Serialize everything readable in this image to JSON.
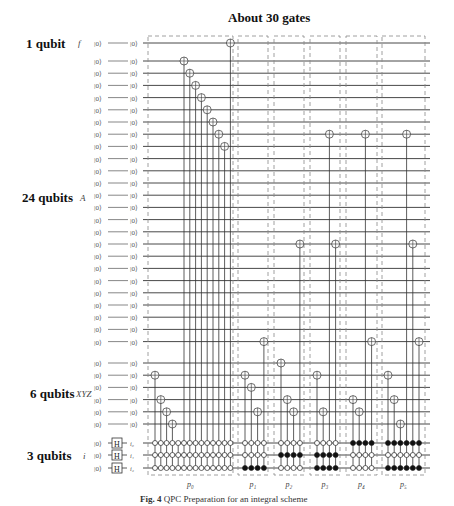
{
  "title": "About 30 gates",
  "caption": {
    "label": "Fig. 4",
    "text": "QPC Preparation for an integral scheme"
  },
  "registers": [
    {
      "group_label": "1 qubit",
      "name": "f",
      "count": 1,
      "init": "|0⟩"
    },
    {
      "group_label": "24 qubits",
      "name": "A",
      "count": 24,
      "init": "|0⟩"
    },
    {
      "group_label": "6 qubits",
      "name": "XYZ",
      "count": 6,
      "init": "|0⟩"
    },
    {
      "group_label": "3 qubits",
      "name": "i",
      "count": 3,
      "init": "|0⟩",
      "gate": "H",
      "wire_labels": [
        "i₀",
        "i₁",
        "i₂"
      ]
    }
  ],
  "blocks": [
    {
      "label": "p₀",
      "controls": [
        "open",
        "open",
        "open"
      ],
      "columns": 14,
      "targets": [
        [
          "XYZ",
          1
        ],
        [
          "XYZ",
          3
        ],
        [
          "XYZ",
          4
        ],
        [
          "XYZ",
          5
        ],
        null,
        [
          "A",
          0
        ],
        [
          "A",
          1
        ],
        [
          "A",
          2
        ],
        [
          "A",
          3
        ],
        [
          "A",
          4
        ],
        [
          "A",
          5
        ],
        [
          "A",
          6
        ],
        [
          "A",
          7
        ],
        [
          "f",
          0
        ]
      ]
    },
    {
      "label": "p₁",
      "controls": [
        "open",
        "open",
        "filled"
      ],
      "columns": 4,
      "targets": [
        [
          "XYZ",
          1
        ],
        [
          "XYZ",
          2
        ],
        [
          "XYZ",
          4
        ],
        [
          "A",
          23
        ]
      ]
    },
    {
      "label": "p₂",
      "controls": [
        "open",
        "filled",
        "open"
      ],
      "columns": 4,
      "targets": [
        [
          "XYZ",
          0
        ],
        [
          "XYZ",
          3
        ],
        [
          "XYZ",
          4
        ],
        [
          "A",
          15
        ]
      ]
    },
    {
      "label": "p₃",
      "controls": [
        "open",
        "filled",
        "filled"
      ],
      "columns": 4,
      "targets": [
        [
          "XYZ",
          1
        ],
        [
          "XYZ",
          4
        ],
        [
          "A",
          6
        ],
        [
          "A",
          15
        ]
      ]
    },
    {
      "label": "p₄",
      "controls": [
        "filled",
        "open",
        "open"
      ],
      "columns": 4,
      "targets": [
        [
          "XYZ",
          3
        ],
        [
          "XYZ",
          4
        ],
        [
          "A",
          6
        ],
        [
          "A",
          23
        ]
      ]
    },
    {
      "label": "p₅",
      "controls": [
        "filled",
        "open",
        "filled"
      ],
      "columns": 6,
      "targets": [
        [
          "XYZ",
          1
        ],
        [
          "XYZ",
          3
        ],
        [
          "XYZ",
          5
        ],
        [
          "A",
          6
        ],
        [
          "A",
          15
        ],
        [
          "A",
          23
        ]
      ]
    }
  ]
}
